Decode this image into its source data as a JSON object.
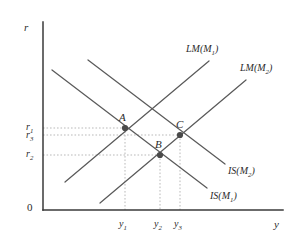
{
  "figure": {
    "type": "is-lm-diagram",
    "axes": {
      "y_axis_label": "r",
      "x_axis_label": "y",
      "origin_label": "0"
    },
    "y_ticks": [
      {
        "id": "r1",
        "base": "r",
        "sub": "1"
      },
      {
        "id": "r3",
        "base": "r",
        "sub": "3"
      },
      {
        "id": "r2",
        "base": "r",
        "sub": "2"
      }
    ],
    "x_ticks": [
      {
        "id": "y1",
        "base": "y",
        "sub": "1"
      },
      {
        "id": "y2",
        "base": "y",
        "sub": "2"
      },
      {
        "id": "y3",
        "base": "y",
        "sub": "3"
      }
    ],
    "curves": [
      {
        "id": "lm1",
        "base": "LM(M",
        "sub": "1",
        "tail": ")",
        "slope": "up"
      },
      {
        "id": "lm2",
        "base": "LM(M",
        "sub": "2",
        "tail": ")",
        "slope": "up"
      },
      {
        "id": "is2",
        "base": "IS(M",
        "sub": "2",
        "tail": ")",
        "slope": "down"
      },
      {
        "id": "is1",
        "base": "IS(M",
        "sub": "1",
        "tail": ")",
        "slope": "down"
      }
    ],
    "points": [
      {
        "id": "A",
        "label": "A",
        "x_tick": "y1",
        "y_tick": "r1"
      },
      {
        "id": "B",
        "label": "B",
        "x_tick": "y2",
        "y_tick": "r2"
      },
      {
        "id": "C",
        "label": "C",
        "x_tick": "y3",
        "y_tick": "r3"
      }
    ],
    "colors": {
      "axis": "#3a3a3a",
      "curve": "#5a5a5a",
      "guide": "#b9b9b9",
      "point": "#4a4a4a",
      "text": "#2b2b2b"
    }
  }
}
